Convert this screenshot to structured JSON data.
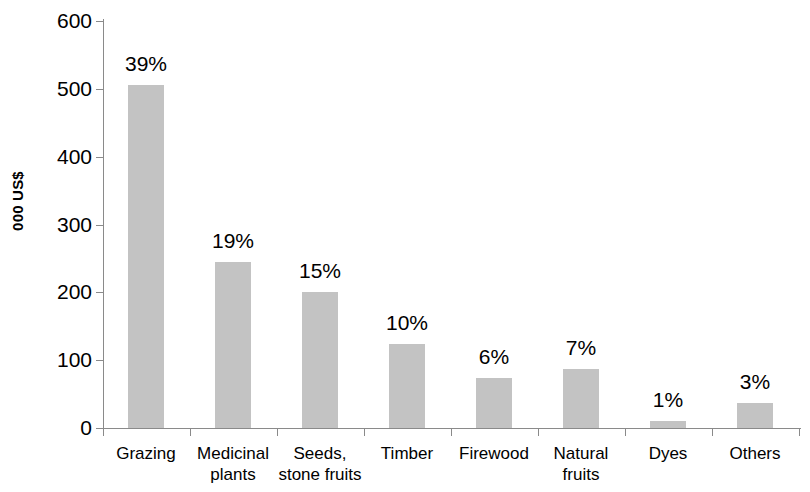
{
  "chart_data": {
    "type": "bar",
    "title": "",
    "subtitle": "",
    "xlabel": "",
    "ylabel": "000 US$",
    "ylim": [
      0,
      600
    ],
    "ytick_labels": [
      "600",
      "500",
      "400",
      "300",
      "200",
      "100",
      "0"
    ],
    "ytick_values": [
      600,
      500,
      400,
      300,
      200,
      100,
      0
    ],
    "ytick_step": 100,
    "grid": false,
    "legend": null,
    "bar_color": "#c3c3c3",
    "axis_color": "#8a8a8a",
    "categories": [
      "Grazing",
      "Medicinal plants",
      "Seeds, stone fruits",
      "Timber",
      "Firewood",
      "Natural fruits",
      "Dyes",
      "Others"
    ],
    "category_label_lines": [
      [
        "Grazing"
      ],
      [
        "Medicinal",
        "plants"
      ],
      [
        "Seeds,",
        "stone fruits"
      ],
      [
        "Timber"
      ],
      [
        "Firewood"
      ],
      [
        "Natural",
        "fruits"
      ],
      [
        "Dyes"
      ],
      [
        "Others"
      ]
    ],
    "values": [
      505,
      245,
      200,
      124,
      73,
      87,
      11,
      37
    ],
    "data_labels": [
      "39%",
      "19%",
      "15%",
      "10%",
      "6%",
      "7%",
      "1%",
      "3%"
    ],
    "percent_shares": [
      39,
      19,
      15,
      10,
      6,
      7,
      1,
      3
    ]
  }
}
